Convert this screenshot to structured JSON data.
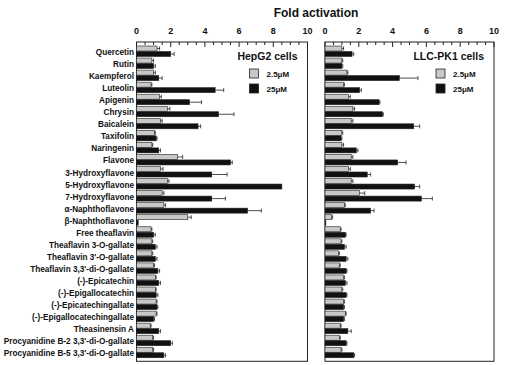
{
  "chart_data": {
    "type": "bar",
    "orientation": "horizontal",
    "title": "Fold activation",
    "xlabel": "Fold activation",
    "ylabel": "",
    "xlim": [
      0,
      10
    ],
    "x_ticks": [
      0,
      2,
      4,
      6,
      8,
      10
    ],
    "grid": false,
    "categories": [
      "Quercetin",
      "Rutin",
      "Kaempferol",
      "Luteolin",
      "Apigenin",
      "Chrysin",
      "Baicalein",
      "Taxifolin",
      "Naringenin",
      "Flavone",
      "3-Hydroxyflavone",
      "5-Hydroxyflavone",
      "7-Hydroxyflavone",
      "α-Naphthoflavone",
      "β-Naphthoflavone",
      "Free theaflavin",
      "Theaflavin 3-O-gallate",
      "Theaflavin 3'-O-gallate",
      "Theaflavin 3,3'-di-O-gallate",
      "(-)-Epicatechin",
      "(-)-Epigallocatechin",
      "(-)-Epicatechingallate",
      "(-)-Epigallocatechingallate",
      "Theasinensin A",
      "Procyanidine B-2 3,3'-di-O-gallate",
      "Procyanidine B-5 3,3'-di-O-gallate"
    ],
    "panels": [
      {
        "name": "HepG2 cells",
        "legend_position": "upper right",
        "series": [
          {
            "name": "2.5μM",
            "color": "#c8c8c8",
            "values": [
              1.2,
              0.9,
              1.0,
              0.85,
              1.35,
              1.8,
              1.4,
              1.05,
              0.9,
              2.4,
              1.4,
              1.8,
              1.5,
              1.6,
              3.0,
              0.85,
              0.9,
              0.9,
              1.0,
              1.1,
              1.1,
              1.15,
              1.15,
              0.8,
              0.95,
              0.95
            ],
            "errors": [
              0.15,
              0.1,
              0.1,
              0.05,
              0.1,
              0.15,
              0.1,
              0.05,
              0.05,
              0.3,
              0.15,
              0.1,
              0.1,
              0.1,
              0.2,
              0.05,
              0.05,
              0.05,
              0.05,
              0.05,
              0.05,
              0.05,
              0.05,
              0.05,
              0.05,
              0.05
            ]
          },
          {
            "name": "25μM",
            "color": "#111111",
            "values": [
              2.0,
              1.0,
              1.3,
              4.6,
              3.1,
              4.8,
              3.6,
              1.15,
              1.3,
              5.5,
              4.4,
              8.5,
              4.4,
              6.5,
              0.1,
              1.0,
              1.1,
              1.1,
              1.25,
              1.3,
              1.15,
              1.2,
              1.0,
              1.3,
              2.0,
              1.6
            ],
            "errors": [
              0.2,
              0.1,
              0.2,
              0.5,
              0.7,
              0.9,
              0.15,
              0.05,
              0.1,
              0.1,
              0.9,
              0.0,
              0.8,
              0.8,
              0.0,
              0.1,
              0.1,
              0.1,
              0.1,
              0.1,
              0.1,
              0.05,
              0.05,
              0.1,
              0.1,
              0.1
            ]
          }
        ]
      },
      {
        "name": "LLC-PK1 cells",
        "legend_position": "upper right",
        "series": [
          {
            "name": "2.5μM",
            "color": "#c8c8c8",
            "values": [
              1.0,
              1.0,
              1.3,
              1.1,
              1.4,
              1.65,
              1.55,
              1.0,
              1.0,
              1.55,
              1.4,
              1.55,
              2.05,
              1.15,
              0.4,
              0.9,
              0.95,
              0.8,
              0.85,
              1.1,
              1.0,
              1.1,
              1.2,
              0.9,
              0.85,
              0.95
            ],
            "errors": [
              0.1,
              0.05,
              0.05,
              0.05,
              0.1,
              0.1,
              0.1,
              0.05,
              0.1,
              0.1,
              0.1,
              0.1,
              0.3,
              0.05,
              0.05,
              0.05,
              0.05,
              0.05,
              0.05,
              0.05,
              0.05,
              0.05,
              0.05,
              0.05,
              0.05,
              0.05
            ]
          },
          {
            "name": "25μM",
            "color": "#111111",
            "values": [
              1.6,
              1.0,
              4.4,
              2.05,
              3.2,
              3.4,
              5.25,
              0.95,
              1.85,
              4.3,
              2.5,
              5.3,
              5.7,
              2.7,
              0.05,
              1.2,
              1.15,
              1.25,
              1.25,
              1.2,
              1.25,
              1.1,
              1.1,
              1.35,
              1.25,
              1.7
            ],
            "errors": [
              0.1,
              0.05,
              1.1,
              0.1,
              0.05,
              0.05,
              0.35,
              0.05,
              0.1,
              0.5,
              0.2,
              0.3,
              0.65,
              0.2,
              0.0,
              0.05,
              0.1,
              0.1,
              0.05,
              0.1,
              0.05,
              0.05,
              0.05,
              0.2,
              0.05,
              0.05
            ]
          }
        ]
      }
    ]
  }
}
